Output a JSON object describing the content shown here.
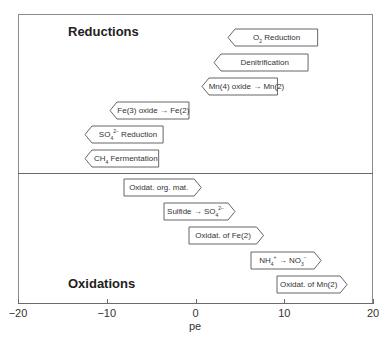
{
  "chart_data": {
    "type": "range",
    "title": "",
    "xlabel": "pe",
    "ylabel": "",
    "xlim": [
      -20,
      20
    ],
    "xticks": [
      -20,
      -10,
      0,
      10,
      20
    ],
    "xtick_labels": [
      "−20",
      "−10",
      "0",
      "10",
      "20"
    ],
    "grid": false,
    "legend": null,
    "sections": [
      {
        "name": "Reductions",
        "direction": "left",
        "items": [
          {
            "label": "O2 Reduction",
            "label_html": "O<sub>2</sub> Reduction",
            "pe_min": 3.7,
            "pe_max": 13.8
          },
          {
            "label": "Denitrification",
            "label_html": "Denitrification",
            "pe_min": 2.1,
            "pe_max": 12.7
          },
          {
            "label": "Mn(4) oxide → Mn(2)",
            "label_html": "Mn(4) oxide → Mn(2)",
            "pe_min": 0.7,
            "pe_max": 9.2
          },
          {
            "label": "Fe(3) oxide → Fe(2)",
            "label_html": "Fe(3) oxide → Fe(2)",
            "pe_min": -9.6,
            "pe_max": -0.7
          },
          {
            "label": "SO4 2- Reduction",
            "label_html": "SO<sub>4</sub><sup>2−</sup> Reduction",
            "pe_min": -12.4,
            "pe_max": -3.6
          },
          {
            "label": "CH4 Fermentation",
            "label_html": "CH<sub>4</sub> Fermentation",
            "pe_min": -12.4,
            "pe_max": -4.1
          }
        ]
      },
      {
        "name": "Oxidations",
        "direction": "right",
        "items": [
          {
            "label": "Oxidat. org. mat.",
            "label_html": "Oxidat. org. mat.",
            "pe_min": -8.1,
            "pe_max": 0.6
          },
          {
            "label": "Sulfide → SO4 2-",
            "label_html": "Sulfide → SO<sub>4</sub><sup>2−</sup>",
            "pe_min": -3.6,
            "pe_max": 4.4
          },
          {
            "label": "Oxidat. of Fe(2)",
            "label_html": "Oxidat. of Fe(2)",
            "pe_min": -0.7,
            "pe_max": 7.7
          },
          {
            "label": "NH4+ → NO3-",
            "label_html": "NH<sub>4</sub><sup>+</sup> → NO<sub>3</sub><sup>−</sup>",
            "pe_min": 6.3,
            "pe_max": 14.2
          },
          {
            "label": "Oxidat. of Mn(2)",
            "label_html": "Oxidat. of Mn(2)",
            "pe_min": 9.2,
            "pe_max": 17.1
          }
        ]
      }
    ]
  },
  "layout": {
    "reductions_title": "Reductions",
    "oxidations_title": "Oxidations",
    "colors": {
      "frame": "#8a8a8a",
      "box_stroke": "#555555",
      "box_fill": "#ffffff",
      "text": "#222222"
    }
  }
}
